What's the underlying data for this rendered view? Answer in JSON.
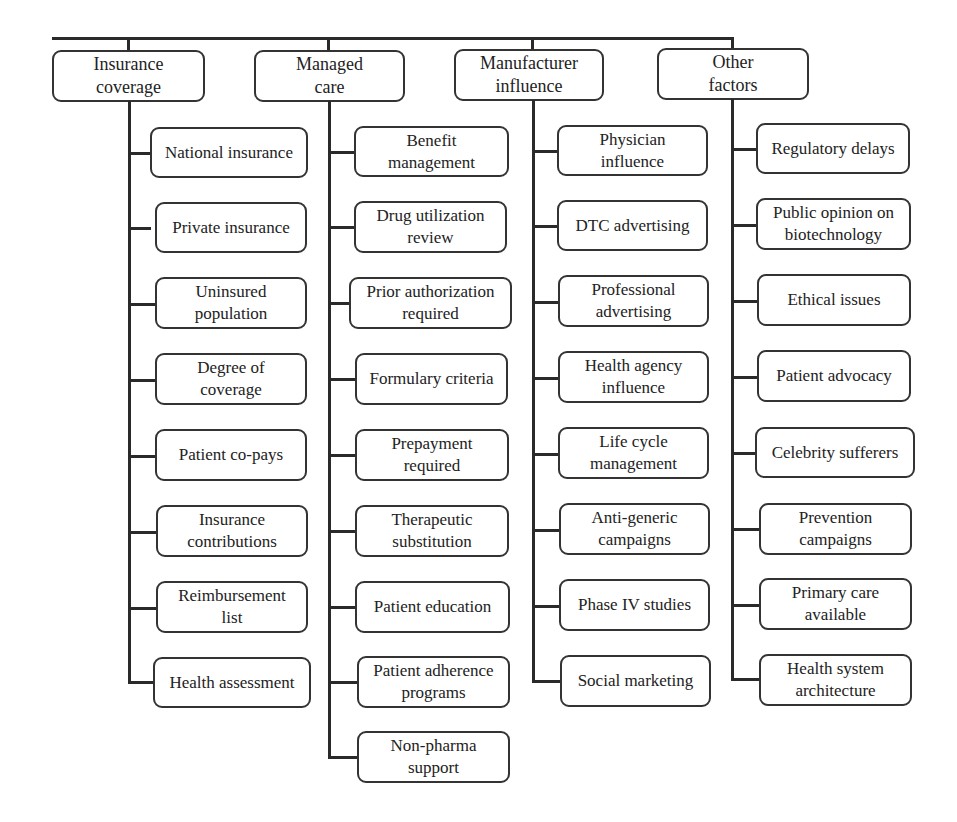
{
  "diagram": {
    "type": "hierarchy-tree",
    "columns": [
      {
        "title": "Insurance\ncoverage",
        "items": [
          "National insurance",
          "Private insurance",
          "Uninsured\npopulation",
          "Degree of\ncoverage",
          "Patient co-pays",
          "Insurance\ncontributions",
          "Reimbursement\nlist",
          "Health assessment"
        ]
      },
      {
        "title": "Managed\ncare",
        "items": [
          "Benefit\nmanagement",
          "Drug utilization\nreview",
          "Prior authorization\nrequired",
          "Formulary criteria",
          "Prepayment\nrequired",
          "Therapeutic\nsubstitution",
          "Patient education",
          "Patient adherence\nprograms",
          "Non-pharma\nsupport"
        ]
      },
      {
        "title": "Manufacturer\ninfluence",
        "items": [
          "Physician\ninfluence",
          "DTC advertising",
          "Professional\nadvertising",
          "Health agency\ninfluence",
          "Life cycle\nmanagement",
          "Anti-generic\ncampaigns",
          "Phase IV studies",
          "Social marketing"
        ]
      },
      {
        "title": "Other\nfactors",
        "items": [
          "Regulatory delays",
          "Public opinion on\nbiotechnology",
          "Ethical issues",
          "Patient advocacy",
          "Celebrity sufferers",
          "Prevention\ncampaigns",
          "Primary care\navailable",
          "Health system\narchitecture"
        ]
      }
    ]
  }
}
